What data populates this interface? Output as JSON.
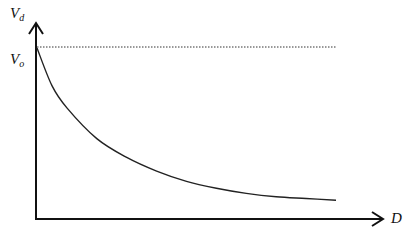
{
  "chart_data": {
    "type": "line",
    "title": "",
    "xlabel": "D",
    "ylabel": "V_d",
    "ylabel_main": "V",
    "ylabel_sub": "d",
    "reference_label_main": "V",
    "reference_label_sub": "o",
    "reference_line": {
      "label": "V_o",
      "style": "dotted",
      "value": 1.0
    },
    "series": [
      {
        "name": "V_d vs D",
        "description": "Monotonically decreasing curve starting at V_o and asymptotically approaching a lower value",
        "x": [
          0.0,
          0.05,
          0.1,
          0.2,
          0.3,
          0.4,
          0.5,
          0.6,
          0.7,
          0.8,
          0.9,
          1.0
        ],
        "y": [
          1.0,
          0.78,
          0.65,
          0.47,
          0.36,
          0.28,
          0.22,
          0.18,
          0.15,
          0.13,
          0.12,
          0.11
        ]
      }
    ],
    "grid": false,
    "legend": null,
    "axis_ticks": false,
    "colors": {
      "axis": "#111111",
      "curve": "#222222",
      "reference": "#333333"
    }
  }
}
